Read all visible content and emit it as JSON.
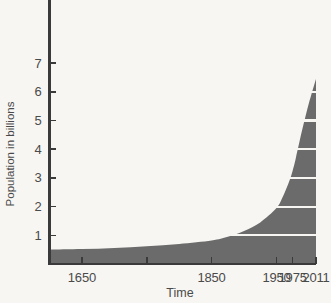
{
  "chart_data": {
    "type": "area",
    "title": "",
    "xlabel": "Time",
    "ylabel": "Population in billions",
    "xlim": [
      1600,
      2011
    ],
    "ylim": [
      0,
      7.6
    ],
    "grid": "horizontal-white-inside-fill",
    "legend": "none",
    "fill_color": "#6b6b6b",
    "background_color": "#f7f6f3",
    "axis_color": "#3a3a3a",
    "gridline_color": "#f7f6f3",
    "y_ticks": [
      1,
      2,
      3,
      4,
      5,
      6,
      7
    ],
    "y_tick_labels": [
      "1",
      "2",
      "3",
      "4",
      "5",
      "6",
      "7"
    ],
    "x_ticks": [
      1650,
      1750,
      1850,
      1950,
      1975,
      2011
    ],
    "x_tick_labels": [
      "1650",
      "",
      "1850",
      "1950",
      "1975",
      "2011"
    ],
    "gridlines_y": [
      1,
      2,
      3,
      4,
      5,
      6
    ],
    "x": [
      1600,
      1650,
      1700,
      1750,
      1800,
      1850,
      1875,
      1900,
      1925,
      1950,
      1960,
      1970,
      1975,
      1980,
      1990,
      2000,
      2011
    ],
    "values": [
      0.5,
      0.52,
      0.56,
      0.62,
      0.7,
      0.82,
      0.95,
      1.15,
      1.45,
      1.95,
      2.35,
      2.9,
      3.25,
      3.7,
      4.7,
      5.6,
      6.45
    ],
    "series": [
      {
        "name": "World population",
        "values": [
          0.5,
          0.52,
          0.56,
          0.62,
          0.7,
          0.82,
          0.95,
          1.15,
          1.45,
          1.95,
          2.35,
          2.9,
          3.25,
          3.7,
          4.7,
          5.6,
          6.45
        ]
      }
    ],
    "annotations": []
  },
  "labels": {
    "y_axis_title": "Population in billions",
    "x_axis_title": "Time"
  }
}
